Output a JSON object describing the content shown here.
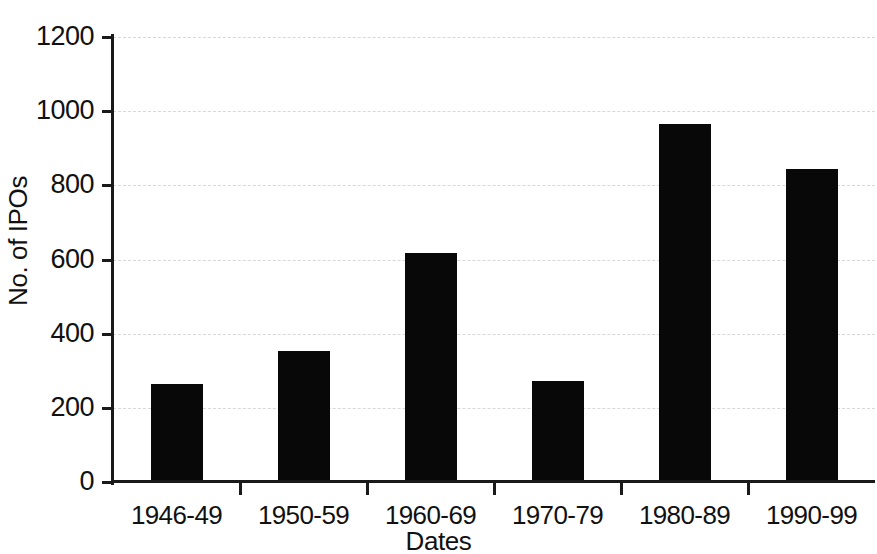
{
  "chart_data": {
    "type": "bar",
    "title": "",
    "subtitle": "",
    "xlabel": "Dates",
    "ylabel": "No. of IPOs",
    "categories": [
      "1946-49",
      "1950-59",
      "1960-69",
      "1970-79",
      "1980-89",
      "1990-99"
    ],
    "values": [
      265,
      352,
      618,
      273,
      965,
      843
    ],
    "series": [
      {
        "name": "No. of IPOs",
        "values": [
          265,
          352,
          618,
          273,
          965,
          843
        ]
      }
    ],
    "ylim": [
      0,
      1200
    ],
    "yticks": [
      0,
      200,
      400,
      600,
      800,
      1000,
      1200
    ],
    "ytick_labels": [
      "0",
      "200",
      "400",
      "600",
      "800",
      "1000",
      "1200"
    ],
    "grid": true,
    "grid_axis": "y",
    "grid_style": "dashed",
    "legend": false,
    "legend_position": "none",
    "bar_color": "#080808",
    "grid_color": "#d8d8d8",
    "axis_color": "#1a1a1a",
    "background_color": "#ffffff"
  },
  "axes": {
    "y_axis_title": "No. of IPOs",
    "x_axis_title": "Dates"
  }
}
